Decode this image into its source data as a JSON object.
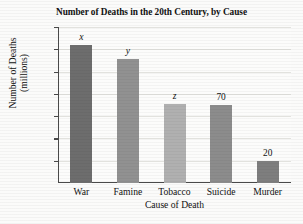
{
  "chart_data": {
    "type": "bar",
    "title": "Number of Deaths in the 20th Century, by Cause",
    "xlabel": "Cause of Death",
    "ylabel_line1": "Number of Deaths",
    "ylabel_line2": "(millions)",
    "categories": [
      "War",
      "Famine",
      "Tobacco",
      "Suicide",
      "Murder"
    ],
    "values": [
      124,
      111,
      71,
      70,
      20
    ],
    "data_labels": [
      "x",
      "y",
      "z",
      "70",
      "20"
    ],
    "data_label_styles": [
      "italic",
      "italic",
      "italic",
      "plain",
      "plain"
    ],
    "bar_colors": [
      "#6d6d6d",
      "#919191",
      "#b0b0b0",
      "#8c8c8c",
      "#7e7e7e"
    ],
    "ylim": [
      0,
      140
    ],
    "yticks": [
      140,
      120,
      100,
      80,
      60,
      40,
      20
    ],
    "ytick_labels": [
      "140",
      "120",
      "100",
      "80",
      "60",
      "40",
      "20"
    ],
    "grid": true,
    "legend": "none",
    "axis_color": "#4a4a4a",
    "grid_color": "#e2e2de",
    "background": "#fbfbfa"
  }
}
